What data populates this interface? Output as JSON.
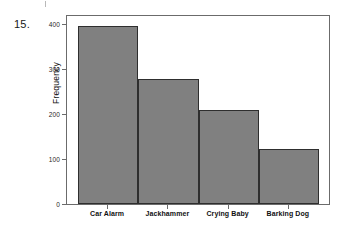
{
  "question": {
    "number": "15."
  },
  "chart_data": {
    "type": "bar",
    "title": "",
    "subtitle": "",
    "xlabel": "",
    "ylabel": "Frequency",
    "categories": [
      "Car Alarm",
      "Jackhammer",
      "Crying Baby",
      "Barking Dog"
    ],
    "values": [
      396,
      278,
      209,
      123
    ],
    "ylim": [
      0,
      400
    ],
    "yticks": [
      0,
      100,
      200,
      300,
      400
    ],
    "ytick_labels": [
      "0",
      "100",
      "200",
      "300",
      "400"
    ],
    "grid": false,
    "legend": false,
    "legend_position": "none",
    "bar_fill_color": "#808080",
    "bar_edge_color": "#2e2e2e",
    "frame_color": "#6b6b6b",
    "bar_gap": 0
  },
  "icons": {
    "scan_mark": "scan-artifact-mark"
  }
}
